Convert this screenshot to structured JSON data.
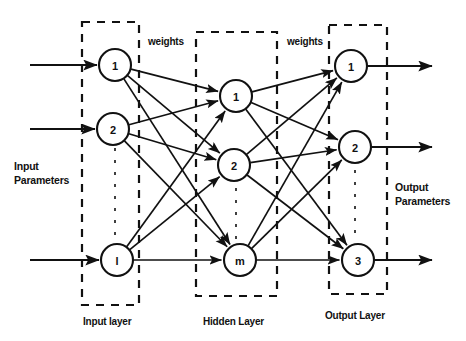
{
  "diagram": {
    "stroke_color": "#111111",
    "node_fill": "#ffffff",
    "background": "#ffffff",
    "labels": {
      "input_parameters_line1": "Input",
      "input_parameters_line2": "Parameters",
      "output_parameters_line1": "Output",
      "output_parameters_line2": "Parameters",
      "weights_left": "weights",
      "weights_right": "weights",
      "input_layer": "Input layer",
      "hidden_layer": "Hidden Layer",
      "output_layer": "Output Layer"
    },
    "layers": [
      {
        "id": "input",
        "name": "Input layer",
        "box": {
          "x": 82,
          "y": 22,
          "w": 57,
          "h": 283
        },
        "nodes": [
          {
            "label": "1",
            "cx": 115,
            "cy": 65,
            "r": 16
          },
          {
            "label": "2",
            "cx": 113,
            "cy": 129,
            "r": 16
          },
          {
            "label": "l",
            "cx": 117,
            "cy": 260,
            "r": 16
          }
        ]
      },
      {
        "id": "hidden",
        "name": "Hidden Layer",
        "box": {
          "x": 196,
          "y": 32,
          "w": 81,
          "h": 264
        },
        "nodes": [
          {
            "label": "1",
            "cx": 236,
            "cy": 96,
            "r": 16
          },
          {
            "label": "2",
            "cx": 234,
            "cy": 165,
            "r": 16
          },
          {
            "label": "m",
            "cx": 240,
            "cy": 260,
            "r": 16
          }
        ]
      },
      {
        "id": "output",
        "name": "Output Layer",
        "box": {
          "x": 329,
          "y": 25,
          "w": 58,
          "h": 269
        },
        "nodes": [
          {
            "label": "1",
            "cx": 351,
            "cy": 66,
            "r": 16
          },
          {
            "label": "2",
            "cx": 355,
            "cy": 147,
            "r": 16
          },
          {
            "label": "3",
            "cx": 358,
            "cy": 260,
            "r": 16
          }
        ]
      }
    ],
    "vertical_ellipses": [
      {
        "x": 115,
        "y1": 148,
        "y2": 240
      },
      {
        "x": 236,
        "y1": 188,
        "y2": 240
      },
      {
        "x": 355,
        "y1": 170,
        "y2": 240
      }
    ],
    "input_arrows": [
      {
        "x1": 30,
        "y1": 65,
        "x2": 97,
        "y2": 65
      },
      {
        "x1": 30,
        "y1": 129,
        "x2": 95,
        "y2": 129
      },
      {
        "x1": 30,
        "y1": 260,
        "x2": 99,
        "y2": 260
      }
    ],
    "output_arrows": [
      {
        "x1": 367,
        "y1": 66,
        "x2": 432,
        "y2": 66
      },
      {
        "x1": 371,
        "y1": 147,
        "x2": 432,
        "y2": 147
      },
      {
        "x1": 374,
        "y1": 260,
        "x2": 432,
        "y2": 260
      }
    ],
    "connections_input_hidden": [
      {
        "from": 0,
        "to": 0
      },
      {
        "from": 0,
        "to": 1
      },
      {
        "from": 0,
        "to": 2
      },
      {
        "from": 1,
        "to": 0
      },
      {
        "from": 1,
        "to": 1
      },
      {
        "from": 1,
        "to": 2
      },
      {
        "from": 2,
        "to": 0
      },
      {
        "from": 2,
        "to": 1
      },
      {
        "from": 2,
        "to": 2
      }
    ],
    "connections_hidden_output": [
      {
        "from": 0,
        "to": 0
      },
      {
        "from": 0,
        "to": 1
      },
      {
        "from": 0,
        "to": 2
      },
      {
        "from": 1,
        "to": 0
      },
      {
        "from": 1,
        "to": 1
      },
      {
        "from": 1,
        "to": 2
      },
      {
        "from": 2,
        "to": 0
      },
      {
        "from": 2,
        "to": 1
      },
      {
        "from": 2,
        "to": 2
      }
    ],
    "label_positions": {
      "input_parameters": {
        "x": 14,
        "y": 159
      },
      "output_parameters": {
        "x": 395,
        "y": 180
      },
      "weights_left": {
        "x": 148,
        "y": 36
      },
      "weights_right": {
        "x": 287,
        "y": 36
      },
      "input_layer": {
        "x": 83,
        "y": 316
      },
      "hidden_layer": {
        "x": 203,
        "y": 316
      },
      "output_layer": {
        "x": 325,
        "y": 310
      }
    }
  }
}
